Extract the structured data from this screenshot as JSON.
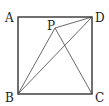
{
  "diagram": {
    "type": "geometry",
    "shape": "square ABCD with interior point P",
    "points": {
      "A": {
        "label": "A",
        "x": 18,
        "y": 17,
        "lx": 5,
        "ly": 22
      },
      "D": {
        "label": "D",
        "x": 92,
        "y": 17,
        "lx": 95,
        "ly": 22
      },
      "B": {
        "label": "B",
        "x": 18,
        "y": 94,
        "lx": 5,
        "ly": 102
      },
      "C": {
        "label": "C",
        "x": 92,
        "y": 94,
        "lx": 95,
        "ly": 102
      },
      "P": {
        "label": "P",
        "x": 55,
        "y": 28,
        "lx": 47,
        "ly": 30
      }
    },
    "segments": [
      [
        "A",
        "D"
      ],
      [
        "D",
        "C"
      ],
      [
        "C",
        "B"
      ],
      [
        "B",
        "A"
      ],
      [
        "B",
        "P"
      ],
      [
        "B",
        "D"
      ],
      [
        "P",
        "D"
      ],
      [
        "P",
        "C"
      ]
    ],
    "stroke_color": "#333333"
  }
}
